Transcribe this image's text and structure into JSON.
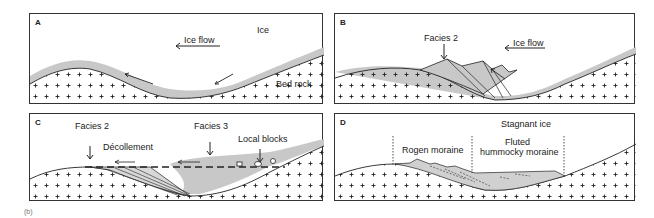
{
  "figure": {
    "tag": "(b)",
    "panels": [
      {
        "id": "A",
        "labels": {
          "ice": "Ice",
          "ice_flow": "Ice flow",
          "bed_rock": "Bed rock"
        }
      },
      {
        "id": "B",
        "labels": {
          "facies": "Facies 2",
          "ice_flow": "Ice flow"
        }
      },
      {
        "id": "C",
        "labels": {
          "facies2": "Facies 2",
          "facies3": "Facies 3",
          "decollement": "Décollement",
          "local_blocks": "Local blocks"
        }
      },
      {
        "id": "D",
        "labels": {
          "stagnant": "Stagnant ice",
          "rogen": "Rogen moraine",
          "fluted_1": "Fluted",
          "fluted_2": "hummocky moraine"
        }
      }
    ]
  },
  "colors": {
    "border": "#333333",
    "ice_sediment": "#c8c8c8",
    "bedrock_cross": "#222222",
    "line": "#222222"
  }
}
